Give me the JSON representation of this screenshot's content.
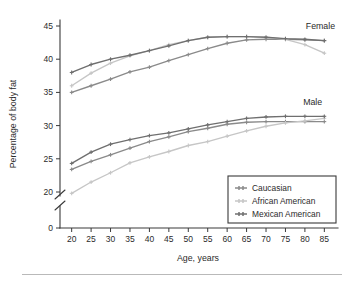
{
  "figure": {
    "background_color": "#ffffff",
    "footer_rule_color": "#b9b9b9"
  },
  "chart_data": {
    "type": "line",
    "title": "",
    "xlabel": "Age, years",
    "ylabel": "Percentage of body fat",
    "x": [
      20,
      25,
      30,
      35,
      40,
      45,
      50,
      55,
      60,
      65,
      70,
      75,
      80,
      85
    ],
    "xlim": [
      17,
      88
    ],
    "ylim": [
      0,
      46
    ],
    "yticks": [
      0,
      20,
      25,
      30,
      35,
      40,
      45
    ],
    "ytick_labels": [
      "0",
      "20",
      "25",
      "30",
      "35",
      "40",
      "45"
    ],
    "xticks": [
      20,
      25,
      30,
      35,
      40,
      45,
      50,
      55,
      60,
      65,
      70,
      75,
      80,
      85
    ],
    "xtick_labels": [
      "20",
      "25",
      "30",
      "35",
      "40",
      "45",
      "50",
      "55",
      "60",
      "65",
      "70",
      "75",
      "80",
      "85"
    ],
    "axis_break": {
      "present": true,
      "between": [
        0,
        20
      ],
      "style": "double-slash"
    },
    "grid": false,
    "legend_position": "lower right",
    "annotations": [
      {
        "text": "Female",
        "x": 84,
        "y": 44.6
      },
      {
        "text": "Male",
        "x": 82,
        "y": 33.1
      }
    ],
    "groups": [
      "Female",
      "Male"
    ],
    "series": [
      {
        "name": "Caucasian",
        "group": "Female",
        "color": "#8a8a8a",
        "values": [
          35.0,
          36.0,
          37.0,
          38.1,
          38.8,
          39.8,
          40.7,
          41.6,
          42.4,
          42.9,
          43.0,
          43.0,
          42.9,
          42.8
        ]
      },
      {
        "name": "African American",
        "group": "Female",
        "color": "#c6c6c6",
        "values": [
          36.0,
          37.9,
          39.4,
          40.5,
          41.3,
          42.2,
          42.8,
          43.3,
          43.4,
          43.4,
          43.3,
          43.0,
          42.2,
          40.9
        ]
      },
      {
        "name": "Mexican American",
        "group": "Female",
        "color": "#6f6f6f",
        "values": [
          38.0,
          39.2,
          40.0,
          40.6,
          41.3,
          42.0,
          42.8,
          43.3,
          43.4,
          43.4,
          43.3,
          43.1,
          43.0,
          42.8
        ]
      },
      {
        "name": "Caucasian",
        "group": "Male",
        "color": "#8a8a8a",
        "values": [
          23.4,
          24.6,
          25.6,
          26.6,
          27.6,
          28.3,
          29.1,
          29.6,
          30.2,
          30.5,
          30.6,
          30.6,
          30.6,
          30.6
        ]
      },
      {
        "name": "African American",
        "group": "Male",
        "color": "#c6c6c6",
        "values": [
          19.8,
          21.5,
          22.9,
          24.4,
          25.3,
          26.1,
          27.0,
          27.6,
          28.4,
          29.2,
          29.9,
          30.4,
          30.7,
          31.1
        ]
      },
      {
        "name": "Mexican American",
        "group": "Male",
        "color": "#6f6f6f",
        "values": [
          24.3,
          26.0,
          27.2,
          27.9,
          28.5,
          28.9,
          29.5,
          30.1,
          30.6,
          31.1,
          31.3,
          31.4,
          31.4,
          31.4
        ]
      }
    ],
    "legend": [
      {
        "label": "Caucasian",
        "color": "#8a8a8a"
      },
      {
        "label": "African American",
        "color": "#c6c6c6"
      },
      {
        "label": "Mexican American",
        "color": "#6f6f6f"
      }
    ]
  }
}
